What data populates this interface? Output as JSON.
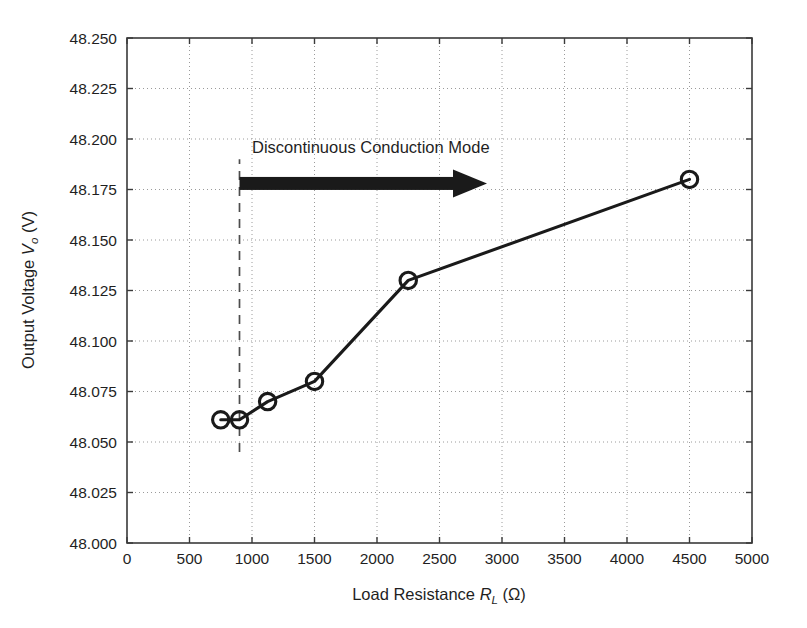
{
  "chart_data": {
    "type": "line",
    "title": "",
    "xlabel": "Load Resistance R_L (Ω)",
    "ylabel": "Output Voltage V_o (V)",
    "xlabel_parts": {
      "lead": "Load Resistance ",
      "symbol": "R",
      "subscript": "L",
      "unit": " (Ω)"
    },
    "ylabel_parts": {
      "lead": "Output Voltage ",
      "symbol": "V",
      "subscript": "o",
      "unit": " (V)"
    },
    "xlim": [
      0,
      5000
    ],
    "ylim": [
      48.0,
      48.25
    ],
    "xticks": [
      0,
      500,
      1000,
      1500,
      2000,
      2500,
      3000,
      3500,
      4000,
      4500,
      5000
    ],
    "xticklabels": [
      "0",
      "500",
      "1000",
      "1500",
      "2000",
      "2500",
      "3000",
      "3500",
      "4000",
      "4500",
      "5000"
    ],
    "yticks": [
      48.0,
      48.025,
      48.05,
      48.075,
      48.1,
      48.125,
      48.15,
      48.175,
      48.2,
      48.225,
      48.25
    ],
    "yticklabels": [
      "48.000",
      "48.025",
      "48.050",
      "48.075",
      "48.100",
      "48.125",
      "48.150",
      "48.175",
      "48.200",
      "48.225",
      "48.250"
    ],
    "grid": true,
    "grid_style": "dotted",
    "legend": null,
    "series": [
      {
        "name": "Output voltage vs load resistance",
        "marker": "circle-open",
        "color": "#1a1a1a",
        "x": [
          750,
          900,
          1125,
          1500,
          2250,
          4500
        ],
        "y": [
          48.061,
          48.061,
          48.07,
          48.08,
          48.13,
          48.18
        ]
      }
    ],
    "annotations": [
      {
        "type": "vertical-dashed-line",
        "name": "dcm-boundary-line",
        "x": 900,
        "y_from": 48.045,
        "y_to": 48.19,
        "color": "#4d4d4d"
      },
      {
        "type": "arrow",
        "name": "dcm-region-arrow",
        "x_from": 900,
        "x_to": 2880,
        "y": 48.178,
        "color": "#1a1a1a"
      },
      {
        "type": "text",
        "name": "dcm-region-label",
        "text": "Discontinuous Conduction Mode",
        "x": 1000,
        "y": 48.193
      }
    ]
  },
  "colors": {
    "background": "#ffffff",
    "axis": "#3a3a3a",
    "grid": "#9a9a9a",
    "data": "#1a1a1a",
    "dashed": "#4d4d4d"
  }
}
